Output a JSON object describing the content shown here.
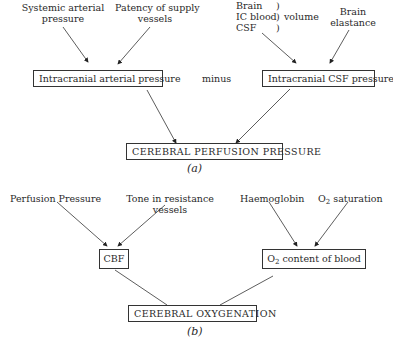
{
  "diagram_a": {
    "inputs": {
      "systemic_pressure": [
        "Systemic arterial",
        "pressure"
      ],
      "patency": [
        "Patency of supply",
        "vessels"
      ],
      "volume_components": [
        "Brain",
        "IC blood",
        "CSF"
      ],
      "volume_label": "volume",
      "brain_elastance": [
        "Brain",
        "elastance"
      ]
    },
    "intermediate": {
      "arterial": "Intracranial arterial pressure",
      "operator": "minus",
      "csf": "Intracranial CSF pressure"
    },
    "output": "CEREBRAL PERFUSION PRESSURE",
    "label": "(a)"
  },
  "diagram_b": {
    "inputs": {
      "perfusion_pressure": "Perfusion Pressure",
      "tone": [
        "Tone in resistance",
        "vessels"
      ],
      "haemoglobin": "Haemoglobin",
      "o2_saturation": {
        "prefix": "O",
        "sub": "2",
        "suffix": " saturation"
      }
    },
    "intermediate": {
      "cbf": "CBF",
      "o2_content": {
        "prefix": "O",
        "sub": "2",
        "suffix": " content of blood"
      }
    },
    "output": "CEREBRAL OXYGENATION",
    "label": "(b)"
  }
}
